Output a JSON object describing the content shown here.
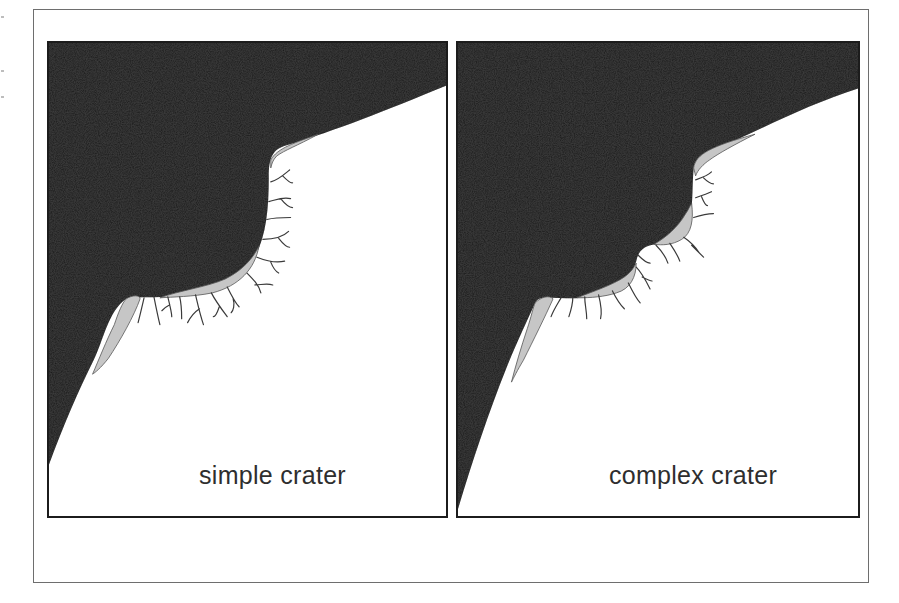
{
  "figure": {
    "panels": [
      {
        "id": "simple",
        "label": "simple crater",
        "description": "Cross-section of a simple (bowl-shaped) impact crater: dark rock mass with a single smooth bowl, light breccia lining and radiating fracture lines"
      },
      {
        "id": "complex",
        "label": "complex crater",
        "description": "Cross-section of a complex impact crater: dark rock mass with stepped/terraced wall, multiple breccia lenses and radiating fracture lines"
      }
    ],
    "colors": {
      "rock_fill": "#1e1e1e",
      "breccia_fill": "#c8c8c8",
      "fracture_stroke": "#3a3a3a",
      "panel_border": "#1c1c1c",
      "frame_border": "#6e6e6e",
      "label_text": "#2e2e2e",
      "background": "#ffffff"
    }
  }
}
